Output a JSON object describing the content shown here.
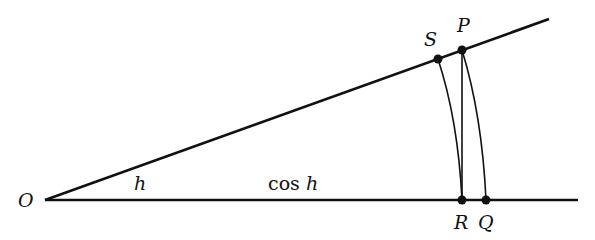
{
  "diagram": {
    "labels": {
      "O": "O",
      "S": "S",
      "P": "P",
      "R": "R",
      "Q": "Q",
      "angle": "h",
      "segment_cos_prefix": "cos",
      "segment_cos_var": "h"
    },
    "points": {
      "O": [
        45,
        200
      ],
      "S": [
        438,
        59
      ],
      "P": [
        462,
        50
      ],
      "R": [
        462,
        200
      ],
      "Q": [
        486,
        200
      ],
      "ray_end": [
        549,
        19
      ],
      "base_end": [
        578,
        200
      ]
    },
    "colors": {
      "ink": "#111111",
      "background": "#ffffff"
    }
  }
}
